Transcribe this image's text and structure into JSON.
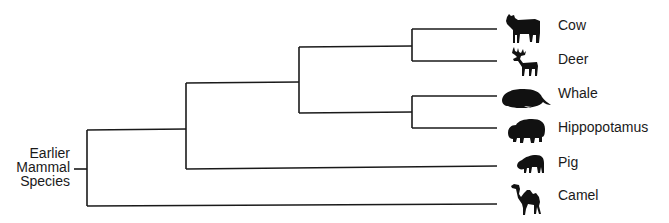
{
  "diagram": {
    "type": "phylogenetic-tree",
    "root": {
      "label_lines": [
        "Earlier",
        "Mammal",
        "Species"
      ]
    },
    "leaves": [
      {
        "name": "Cow",
        "icon": "cow-icon"
      },
      {
        "name": "Deer",
        "icon": "deer-icon"
      },
      {
        "name": "Whale",
        "icon": "whale-icon"
      },
      {
        "name": "Hippopotamus",
        "icon": "hippopotamus-icon"
      },
      {
        "name": "Pig",
        "icon": "pig-icon"
      },
      {
        "name": "Camel",
        "icon": "camel-icon"
      }
    ],
    "structure": "(Camel,(Pig,((Cow,Deer),(Whale,Hippopotamus))))",
    "line_color": "#1a1a1a"
  }
}
